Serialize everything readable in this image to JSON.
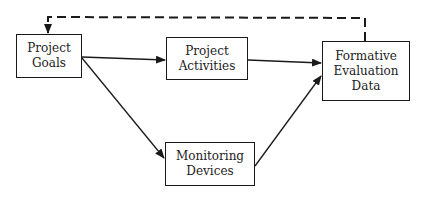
{
  "diagram": {
    "nodes": {
      "goals": {
        "lines": [
          "Project",
          "Goals"
        ]
      },
      "activities": {
        "lines": [
          "Project",
          "Activities"
        ]
      },
      "evaluation": {
        "lines": [
          "Formative",
          "Evaluation",
          "Data"
        ]
      },
      "monitoring": {
        "lines": [
          "Monitoring",
          "Devices"
        ]
      }
    },
    "edges": [
      {
        "from": "Project Goals",
        "to": "Project Activities",
        "style": "solid"
      },
      {
        "from": "Project Activities",
        "to": "Formative Evaluation Data",
        "style": "solid"
      },
      {
        "from": "Project Goals",
        "to": "Monitoring Devices",
        "style": "solid"
      },
      {
        "from": "Monitoring Devices",
        "to": "Formative Evaluation Data",
        "style": "solid"
      },
      {
        "from": "Formative Evaluation Data",
        "to": "Project Goals",
        "style": "dashed"
      }
    ],
    "colors": {
      "line": "#1a1a1a",
      "text": "#222222",
      "background": "#ffffff"
    }
  }
}
